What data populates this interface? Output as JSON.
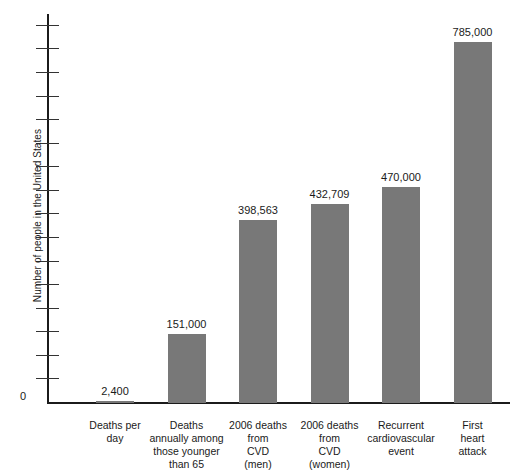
{
  "chart_data": {
    "type": "bar",
    "title": "",
    "subtitle": "",
    "xlabel": "",
    "ylabel": "Number of people in the United States",
    "categories": [
      "Deaths per day",
      "Deaths annually among those younger than 65",
      "2006 deaths from CVD (men)",
      "2006 deaths from CVD (women)",
      "Recurrent cardiovascular event",
      "First heart attack"
    ],
    "category_lines": [
      [
        "Deaths per",
        "day"
      ],
      [
        "Deaths",
        "annually among",
        "those younger",
        "than 65"
      ],
      [
        "2006 deaths",
        "from",
        "CVD",
        "(men)"
      ],
      [
        "2006 deaths",
        "from",
        "CVD",
        "(women)"
      ],
      [
        "Recurrent",
        "cardiovascular",
        "event"
      ],
      [
        "First",
        "heart",
        "attack"
      ]
    ],
    "values": [
      2400,
      151000,
      398563,
      432709,
      470000,
      785000
    ],
    "value_labels": [
      "2,400",
      "151,000",
      "398,563",
      "432,709",
      "470,000",
      "785,000"
    ],
    "ylim": [
      0,
      800000
    ],
    "ytick_labels": [
      "0"
    ],
    "ytick_count": 16,
    "grid": false,
    "legend": false,
    "bar_color": "#787878",
    "axis_color": "#1b1b1b",
    "background_color": "#ffffff"
  },
  "axes": {
    "y_zero_label": "0"
  }
}
